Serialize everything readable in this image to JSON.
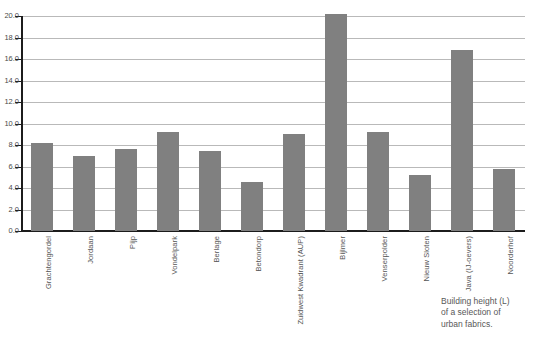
{
  "chart_data": {
    "type": "bar",
    "title": "",
    "xlabel": "",
    "ylabel": "",
    "ylim": [
      0.0,
      20.0
    ],
    "ytick_step": 2.0,
    "grid": true,
    "legend": "none",
    "bar_color": "#808080",
    "gridline_color": "#b9b9b9",
    "axis_color": "#1c1c1c",
    "categories": [
      "Grachtengordel",
      "Jordaan",
      "Pijp",
      "Vondelpark",
      "Berlage",
      "Betondorp",
      "Zuidwest Kwadrant (AUP)",
      "Bijlmer",
      "Venserpolder",
      "Nieuw Sloten",
      "Java (IJ-oevers)",
      "Noorderhof"
    ],
    "values": [
      8.2,
      7.0,
      7.6,
      9.2,
      7.4,
      4.6,
      9.0,
      20.2,
      9.2,
      5.2,
      16.8,
      5.8
    ],
    "ytick_labels": [
      "0.0",
      "2.0",
      "4.0",
      "6.0",
      "8.0",
      "10.0",
      "12.0",
      "14.0",
      "16.0",
      "18.0",
      "20.0"
    ],
    "ytick_values": [
      0.0,
      2.0,
      4.0,
      6.0,
      8.0,
      10.0,
      12.0,
      14.0,
      16.0,
      18.0,
      20.0
    ]
  },
  "caption": {
    "line1": "Building height (L)",
    "line2": "of a selection of",
    "line3": "urban fabrics."
  }
}
